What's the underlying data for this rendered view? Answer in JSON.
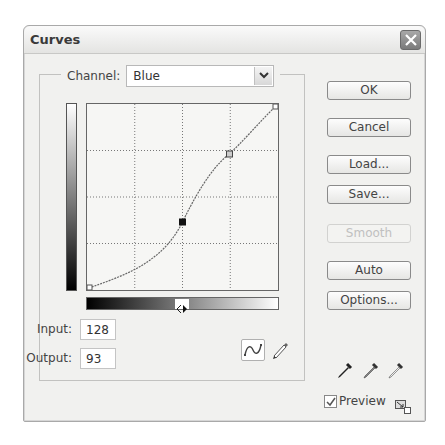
{
  "window": {
    "title": "Curves",
    "close_icon": "close-x-icon"
  },
  "channel": {
    "label": "Channel:",
    "selected": "Blue"
  },
  "graph": {
    "grid_divisions": 4,
    "range": [
      0,
      255
    ],
    "control_points": [
      {
        "input": 0,
        "output": 0,
        "selected": false
      },
      {
        "input": 128,
        "output": 93,
        "selected": true
      },
      {
        "input": 190,
        "output": 185,
        "selected": false
      },
      {
        "input": 255,
        "output": 255,
        "selected": false
      }
    ],
    "input_gradient": "black-to-white",
    "output_gradient": "white-to-black",
    "gradient_toggle_icon": "left-right-arrows-icon"
  },
  "fields": {
    "input_label": "Input:",
    "input_value": "128",
    "output_label": "Output:",
    "output_value": "93"
  },
  "tools": {
    "curve_tool": "curve-point-tool-icon",
    "pencil_tool": "pencil-icon"
  },
  "buttons": {
    "ok": "OK",
    "cancel": "Cancel",
    "load": "Load...",
    "save": "Save...",
    "smooth": "Smooth",
    "auto": "Auto",
    "options": "Options..."
  },
  "eyedroppers": [
    "black-eyedropper-icon",
    "gray-eyedropper-icon",
    "white-eyedropper-icon"
  ],
  "preview": {
    "label": "Preview",
    "checked": true
  }
}
